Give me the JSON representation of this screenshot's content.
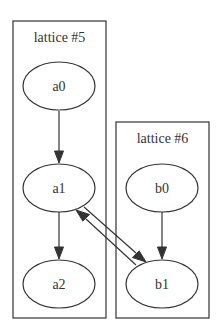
{
  "diagram": {
    "type": "graphviz-digraph",
    "clusters": [
      {
        "id": "cluster5",
        "label": "lattice #5",
        "nodes": [
          "a0",
          "a1",
          "a2"
        ]
      },
      {
        "id": "cluster6",
        "label": "lattice #6",
        "nodes": [
          "b0",
          "b1"
        ]
      }
    ],
    "nodes": [
      {
        "id": "a0",
        "label": "a0"
      },
      {
        "id": "a1",
        "label": "a1"
      },
      {
        "id": "a2",
        "label": "a2"
      },
      {
        "id": "b0",
        "label": "b0"
      },
      {
        "id": "b1",
        "label": "b1"
      }
    ],
    "edges": [
      {
        "from": "a0",
        "to": "a1"
      },
      {
        "from": "a1",
        "to": "a2"
      },
      {
        "from": "b0",
        "to": "b1"
      },
      {
        "from": "a1",
        "to": "b1"
      },
      {
        "from": "b1",
        "to": "a1"
      }
    ]
  }
}
